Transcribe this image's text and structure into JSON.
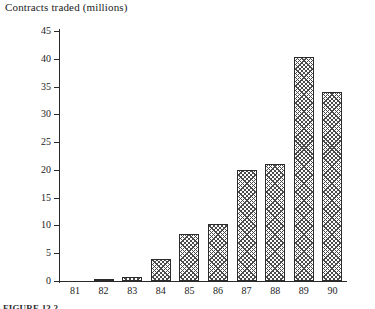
{
  "chart_data": {
    "type": "bar",
    "title": "Contracts traded (millions)",
    "xlabel": "",
    "ylabel": "Contracts traded (millions)",
    "categories": [
      "81",
      "82",
      "83",
      "84",
      "85",
      "86",
      "87",
      "88",
      "89",
      "90"
    ],
    "values": [
      0,
      0.3,
      0.8,
      4.0,
      8.5,
      10.3,
      20.0,
      21.1,
      40.3,
      34.0
    ],
    "ylim": [
      0,
      45
    ],
    "yticks": [
      0,
      5,
      10,
      15,
      20,
      25,
      30,
      35,
      40,
      45
    ],
    "ytick_labels": [
      "0",
      "5",
      "10",
      "15",
      "20",
      "25",
      "30",
      "35",
      "40",
      "45"
    ],
    "grid": false,
    "legend": null,
    "bar_fill": "cross-hatch",
    "bar_outline_color": "#2b2b2b",
    "hatch_color": "#4a4a4a",
    "axis_color": "#2a2a2a",
    "background": "#ffffff"
  },
  "caption": {
    "text": "FIGURE 13.2"
  }
}
